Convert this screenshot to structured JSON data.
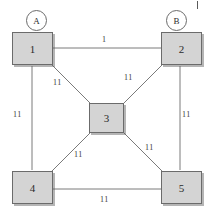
{
  "diagram": {
    "background_color": "#ffffff",
    "node_fill_color": "#d4d4d4",
    "node_border_color": "#6b6b6b",
    "edge_color": "#7a7a7a",
    "label_color": "#3a3a3a"
  },
  "terminals": [
    {
      "id": "A",
      "label": "A"
    },
    {
      "id": "B",
      "label": "B"
    }
  ],
  "nodes": [
    {
      "id": "n1",
      "label": "1"
    },
    {
      "id": "n2",
      "label": "2"
    },
    {
      "id": "n3",
      "label": "3"
    },
    {
      "id": "n4",
      "label": "4"
    },
    {
      "id": "n5",
      "label": "5"
    }
  ],
  "edges": [
    {
      "id": "e1-2",
      "from": "1",
      "to": "2",
      "weight": "1"
    },
    {
      "id": "e1-3",
      "from": "1",
      "to": "3",
      "weight": "11"
    },
    {
      "id": "e2-3",
      "from": "2",
      "to": "3",
      "weight": "11"
    },
    {
      "id": "e1-4",
      "from": "1",
      "to": "4",
      "weight": "11"
    },
    {
      "id": "e2-5",
      "from": "2",
      "to": "5",
      "weight": "11"
    },
    {
      "id": "e3-4",
      "from": "3",
      "to": "4",
      "weight": "11"
    },
    {
      "id": "e3-5",
      "from": "3",
      "to": "5",
      "weight": "11"
    },
    {
      "id": "e4-5",
      "from": "4",
      "to": "5",
      "weight": "11"
    }
  ]
}
